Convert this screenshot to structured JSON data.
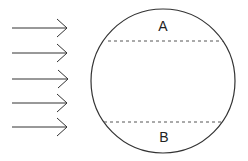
{
  "diagram": {
    "arrows": {
      "count": 5,
      "direction": "right",
      "y": [
        28,
        53,
        79,
        103,
        127
      ],
      "x_start": 12,
      "x_end": 68
    },
    "circle": {
      "cx": 163,
      "cy": 81,
      "r": 72
    },
    "chords": [
      {
        "name": "upper",
        "y": 41,
        "style": "dashed"
      },
      {
        "name": "lower",
        "y": 122,
        "style": "dashed"
      }
    ],
    "labels": {
      "top_region": "A",
      "bottom_region": "B"
    },
    "colors": {
      "stroke": "#333333",
      "background": "#ffffff"
    }
  }
}
